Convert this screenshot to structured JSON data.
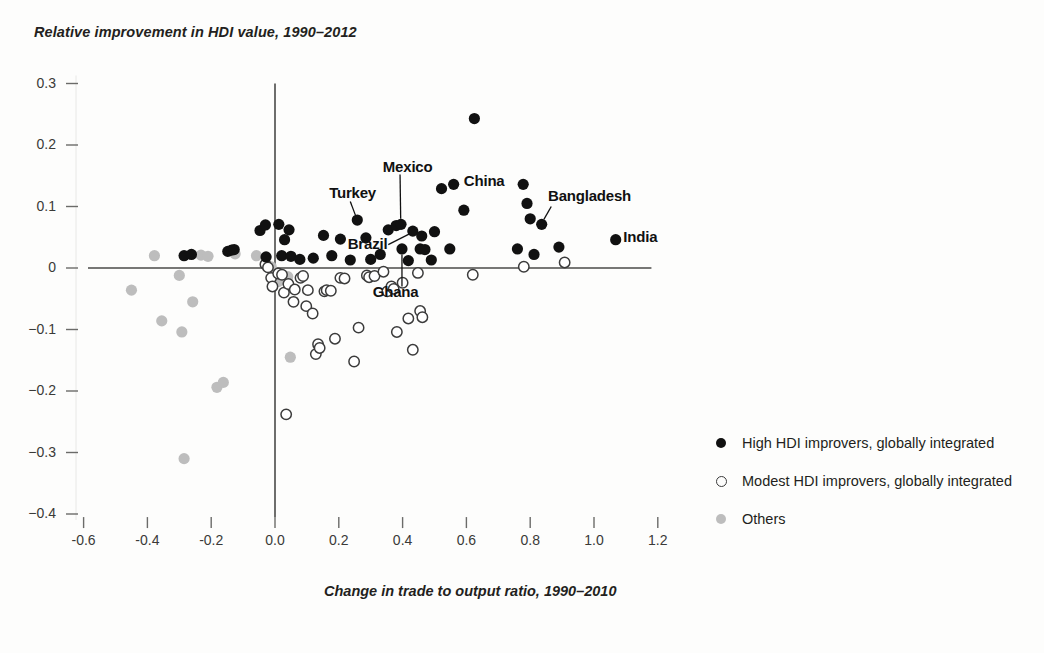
{
  "chart_data": {
    "type": "scatter",
    "title": "Relative improvement in HDI value, 1990–2012",
    "xlabel": "Change in trade to output ratio, 1990–2010",
    "ylabel": "Relative improvement in HDI value, 1990–2012",
    "xlim": [
      -0.6,
      1.2
    ],
    "ylim": [
      -0.4,
      0.3
    ],
    "xticks": [
      "-0.6",
      "-0.4",
      "-0.2",
      "0.0",
      "0.2",
      "0.4",
      "0.6",
      "0.8",
      "1.0",
      "1.2"
    ],
    "xtick_values": [
      -0.6,
      -0.4,
      -0.2,
      0.0,
      0.2,
      0.4,
      0.6,
      0.8,
      1.0,
      1.2
    ],
    "yticks": [
      "0.3",
      "0.2",
      "0.1",
      "0",
      "−0.1",
      "−0.2",
      "−0.3",
      "−0.4"
    ],
    "ytick_values": [
      0.3,
      0.2,
      0.1,
      0.0,
      -0.1,
      -0.2,
      -0.3,
      -0.4
    ],
    "grid": false,
    "legend_position": "right",
    "series": [
      {
        "name": "High HDI improvers, globally integrated",
        "marker": "filled-circle",
        "color": "#111111",
        "points": [
          [
            -0.285,
            0.02
          ],
          [
            -0.262,
            0.022
          ],
          [
            -0.148,
            0.027
          ],
          [
            -0.136,
            0.029
          ],
          [
            -0.128,
            0.03
          ],
          [
            -0.047,
            0.061
          ],
          [
            -0.03,
            0.07
          ],
          [
            -0.028,
            0.018
          ],
          [
            0.012,
            0.071
          ],
          [
            0.021,
            0.02
          ],
          [
            0.03,
            0.046
          ],
          [
            0.044,
            0.062
          ],
          [
            0.05,
            0.019
          ],
          [
            0.078,
            0.014
          ],
          [
            0.12,
            0.016
          ],
          [
            0.152,
            0.053
          ],
          [
            0.178,
            0.02
          ],
          [
            0.205,
            0.047
          ],
          [
            0.236,
            0.013
          ],
          [
            0.258,
            0.078
          ],
          [
            0.285,
            0.049
          ],
          [
            0.3,
            0.014
          ],
          [
            0.33,
            0.022
          ],
          [
            0.355,
            0.062
          ],
          [
            0.38,
            0.069
          ],
          [
            0.395,
            0.071
          ],
          [
            0.398,
            0.031
          ],
          [
            0.418,
            0.012
          ],
          [
            0.432,
            0.06
          ],
          [
            0.455,
            0.031
          ],
          [
            0.46,
            0.052
          ],
          [
            0.47,
            0.03
          ],
          [
            0.49,
            0.013
          ],
          [
            0.5,
            0.059
          ],
          [
            0.522,
            0.129
          ],
          [
            0.548,
            0.031
          ],
          [
            0.56,
            0.136
          ],
          [
            0.592,
            0.094
          ],
          [
            0.625,
            0.243
          ],
          [
            0.76,
            0.031
          ],
          [
            0.778,
            0.136
          ],
          [
            0.79,
            0.105
          ],
          [
            0.8,
            0.08
          ],
          [
            0.812,
            0.022
          ],
          [
            0.836,
            0.071
          ],
          [
            0.89,
            0.034
          ],
          [
            1.068,
            0.046
          ]
        ]
      },
      {
        "name": "Modest HDI improvers, globally integrated",
        "marker": "open-circle",
        "color": "#3b3b3b",
        "points": [
          [
            -0.03,
            0.006
          ],
          [
            -0.022,
            0.001
          ],
          [
            -0.012,
            -0.016
          ],
          [
            -0.008,
            -0.03
          ],
          [
            0.01,
            -0.009
          ],
          [
            0.022,
            -0.011
          ],
          [
            0.028,
            -0.04
          ],
          [
            0.035,
            -0.238
          ],
          [
            0.042,
            -0.026
          ],
          [
            0.058,
            -0.055
          ],
          [
            0.062,
            -0.035
          ],
          [
            0.08,
            -0.016
          ],
          [
            0.088,
            -0.013
          ],
          [
            0.098,
            -0.062
          ],
          [
            0.103,
            -0.036
          ],
          [
            0.118,
            -0.074
          ],
          [
            0.128,
            -0.14
          ],
          [
            0.135,
            -0.124
          ],
          [
            0.14,
            -0.13
          ],
          [
            0.155,
            -0.038
          ],
          [
            0.162,
            -0.036
          ],
          [
            0.175,
            -0.037
          ],
          [
            0.188,
            -0.115
          ],
          [
            0.205,
            -0.016
          ],
          [
            0.218,
            -0.017
          ],
          [
            0.248,
            -0.152
          ],
          [
            0.262,
            -0.097
          ],
          [
            0.288,
            -0.012
          ],
          [
            0.295,
            -0.015
          ],
          [
            0.312,
            -0.013
          ],
          [
            0.34,
            -0.006
          ],
          [
            0.352,
            -0.038
          ],
          [
            0.365,
            -0.03
          ],
          [
            0.372,
            -0.034
          ],
          [
            0.382,
            -0.104
          ],
          [
            0.4,
            -0.024
          ],
          [
            0.418,
            -0.082
          ],
          [
            0.432,
            -0.133
          ],
          [
            0.448,
            -0.008
          ],
          [
            0.455,
            -0.07
          ],
          [
            0.462,
            -0.08
          ],
          [
            0.62,
            -0.011
          ],
          [
            0.78,
            0.002
          ],
          [
            0.908,
            0.009
          ]
        ]
      },
      {
        "name": "Others",
        "marker": "gray-circle",
        "color": "#bdbdbd",
        "points": [
          [
            -0.45,
            -0.036
          ],
          [
            -0.378,
            0.02
          ],
          [
            -0.355,
            -0.086
          ],
          [
            -0.3,
            -0.012
          ],
          [
            -0.292,
            -0.104
          ],
          [
            -0.285,
            -0.31
          ],
          [
            -0.258,
            -0.055
          ],
          [
            -0.232,
            0.021
          ],
          [
            -0.21,
            0.019
          ],
          [
            -0.182,
            -0.194
          ],
          [
            -0.162,
            -0.186
          ],
          [
            -0.125,
            0.023
          ],
          [
            -0.058,
            0.02
          ],
          [
            -0.012,
            0.002
          ],
          [
            0.008,
            -0.01
          ],
          [
            0.01,
            -0.022
          ],
          [
            0.04,
            -0.014
          ],
          [
            0.048,
            -0.145
          ]
        ]
      }
    ],
    "annotations": [
      {
        "label": "Turkey",
        "point": [
          0.258,
          0.078
        ],
        "label_x": 0.176,
        "label_y": 0.12,
        "leader": true
      },
      {
        "label": "Mexico",
        "point": [
          0.395,
          0.071
        ],
        "label_x": 0.338,
        "label_y": 0.163,
        "leader": true
      },
      {
        "label": "Brazil",
        "point": [
          0.432,
          0.06
        ],
        "label_x": 0.228,
        "label_y": 0.037,
        "leader": true
      },
      {
        "label": "Ghana",
        "point": [
          0.398,
          0.031
        ],
        "label_x": 0.388,
        "label_y": -0.04,
        "leader": true
      },
      {
        "label": "China",
        "point": [
          0.56,
          0.136
        ],
        "label_x": 0.592,
        "label_y": 0.14,
        "leader": false
      },
      {
        "label": "Bangladesh",
        "point": [
          0.836,
          0.071
        ],
        "label_x": 0.856,
        "label_y": 0.116,
        "leader": true
      },
      {
        "label": "India",
        "point": [
          1.068,
          0.046
        ],
        "label_x": 1.092,
        "label_y": 0.048,
        "leader": false
      }
    ]
  },
  "legend": {
    "items": [
      {
        "label": "High HDI improvers, globally integrated",
        "marker": "filled-circle"
      },
      {
        "label": "Modest HDI improvers, globally integrated",
        "marker": "open-circle"
      },
      {
        "label": "Others",
        "marker": "gray-circle"
      }
    ]
  },
  "colors": {
    "background": "#fdfdfc",
    "axis": "#4a4a48",
    "high_improvers": "#111111",
    "modest_improvers": "#3b3b3b",
    "others": "#bdbdbd",
    "text": "#231f20"
  }
}
